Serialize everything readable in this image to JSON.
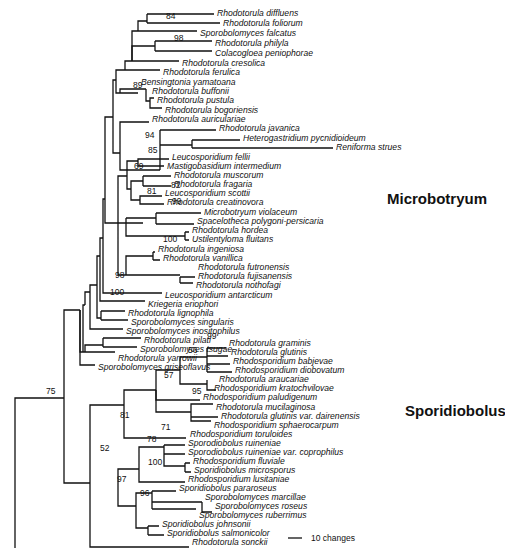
{
  "figure": {
    "type": "phylogenetic-tree",
    "clade_labels": [
      {
        "label": "Microbotryum",
        "x": 387,
        "y": 204
      },
      {
        "label": "Sporidiobolus",
        "x": 405,
        "y": 416
      }
    ],
    "scale_bar": {
      "label": "10 changes",
      "x1": 288,
      "x2": 302,
      "y": 538
    }
  },
  "taxa": [
    {
      "name": "Rhodotorula diffluens",
      "x": 217,
      "y": 13
    },
    {
      "name": "Rhodotorula foliorum",
      "x": 223,
      "y": 23
    },
    {
      "name": "Sporobolomyces falcatus",
      "x": 200,
      "y": 33
    },
    {
      "name": "Rhodotorula philyla",
      "x": 215,
      "y": 43
    },
    {
      "name": "Colacogloea peniophorae",
      "x": 215,
      "y": 53
    },
    {
      "name": "Rhodotorula cresolica",
      "x": 182,
      "y": 63
    },
    {
      "name": "Rhodotorula ferulica",
      "x": 163,
      "y": 72
    },
    {
      "name": "Bensingtonia yamatoana",
      "x": 141,
      "y": 82
    },
    {
      "name": "Rhodotorula buffonii",
      "x": 152,
      "y": 91
    },
    {
      "name": "Rhodotorula pustula",
      "x": 157,
      "y": 100
    },
    {
      "name": "Rhodotorula bogoriensis",
      "x": 165,
      "y": 110
    },
    {
      "name": "Rhodotorula auriculariae",
      "x": 152,
      "y": 119
    },
    {
      "name": "Rhodotorula javanica",
      "x": 219,
      "y": 128
    },
    {
      "name": "Heterogastridium pycnidioideum",
      "x": 243,
      "y": 138
    },
    {
      "name": "Reniforma strues",
      "x": 336,
      "y": 147
    },
    {
      "name": "Leucosporidium fellii",
      "x": 172,
      "y": 157
    },
    {
      "name": "Mastigobasidium intermedium",
      "x": 167,
      "y": 166
    },
    {
      "name": "Rhodotorula muscorum",
      "x": 174,
      "y": 175
    },
    {
      "name": "Rhodotorula fragaria",
      "x": 174,
      "y": 184
    },
    {
      "name": "Leucosporidium scottii",
      "x": 165,
      "y": 193
    },
    {
      "name": "Rhodotorula creatinovora",
      "x": 167,
      "y": 202
    },
    {
      "name": "Microbotryum violaceum",
      "x": 204,
      "y": 212
    },
    {
      "name": "Spacelotheca polygoni-persicaria",
      "x": 197,
      "y": 221
    },
    {
      "name": "Rhodotorula hordea",
      "x": 192,
      "y": 230
    },
    {
      "name": "Ustilentyloma fluitans",
      "x": 192,
      "y": 239
    },
    {
      "name": "Rhodotorula ingeniosa",
      "x": 158,
      "y": 249
    },
    {
      "name": "Rhodotorula vanillica",
      "x": 163,
      "y": 258
    },
    {
      "name": "Rhodotorula futronensis",
      "x": 198,
      "y": 267
    },
    {
      "name": "Rhodotorula fujisanensis",
      "x": 198,
      "y": 276
    },
    {
      "name": "Rhodotorula nothofagi",
      "x": 196,
      "y": 285
    },
    {
      "name": "Leucosporidium antarcticum",
      "x": 165,
      "y": 295
    },
    {
      "name": "Kriegeria eriophori",
      "x": 148,
      "y": 304
    },
    {
      "name": "Rhodotorula lignophila",
      "x": 128,
      "y": 313
    },
    {
      "name": "Sporobolomyces singularis",
      "x": 131,
      "y": 322
    },
    {
      "name": "Sporobolomyces inositophilus",
      "x": 126,
      "y": 331
    },
    {
      "name": "Rhodotorula pilati",
      "x": 144,
      "y": 340
    },
    {
      "name": "Sporobolomyces tsugae",
      "x": 140,
      "y": 349
    },
    {
      "name": "Rhodotorula yarrowii",
      "x": 118,
      "y": 358
    },
    {
      "name": "Sporobolomyces griseoflavus",
      "x": 98,
      "y": 367
    },
    {
      "name": "Rhodotorula graminis",
      "x": 229,
      "y": 343
    },
    {
      "name": "Rhodotorula glutinis",
      "x": 231,
      "y": 352
    },
    {
      "name": "Rhodosporidium babjevae",
      "x": 233,
      "y": 361
    },
    {
      "name": "Rhodosporidium diobovatum",
      "x": 235,
      "y": 370
    },
    {
      "name": "Rhodotorula araucariae",
      "x": 219,
      "y": 379
    },
    {
      "name": "Rhodosporidium kratochvilovae",
      "x": 214,
      "y": 388
    },
    {
      "name": "Rhodosporidium paludigenum",
      "x": 203,
      "y": 397
    },
    {
      "name": "Rhodotorula mucilaginosa",
      "x": 216,
      "y": 407
    },
    {
      "name": "Rhodotorula glutinis var. dairenensis",
      "x": 221,
      "y": 416
    },
    {
      "name": "Rhodosporidium sphaerocarpum",
      "x": 214,
      "y": 425
    },
    {
      "name": "Rhodosporidium toruloides",
      "x": 190,
      "y": 434
    },
    {
      "name": "Sporodiobolus ruineniae",
      "x": 188,
      "y": 443
    },
    {
      "name": "Sporodiobolus ruineniae var.  coprophilus",
      "x": 188,
      "y": 452
    },
    {
      "name": "Rhodosporidium fluviale",
      "x": 193,
      "y": 461
    },
    {
      "name": "Sporidiobolus microsporus",
      "x": 194,
      "y": 470
    },
    {
      "name": "Rhodosporidium lusitaniae",
      "x": 188,
      "y": 479
    },
    {
      "name": "Sporidiobolus pararoseus",
      "x": 179,
      "y": 488
    },
    {
      "name": "Sporobolomyces marcillae",
      "x": 205,
      "y": 497
    },
    {
      "name": "Sporobolomyces roseus",
      "x": 215,
      "y": 506
    },
    {
      "name": "Sporobolomyces ruberrimus",
      "x": 199,
      "y": 515
    },
    {
      "name": "Sporidiobolus johnsonii",
      "x": 162,
      "y": 524
    },
    {
      "name": "Sporidiobolus salmonicolor",
      "x": 167,
      "y": 533
    },
    {
      "name": "Rhodotorula sonckii",
      "x": 192,
      "y": 542
    }
  ],
  "bootstrap": [
    {
      "value": "84",
      "x": 166,
      "y": 19
    },
    {
      "value": "98",
      "x": 174,
      "y": 41
    },
    {
      "value": "89",
      "x": 133,
      "y": 88
    },
    {
      "value": "94",
      "x": 145,
      "y": 138
    },
    {
      "value": "85",
      "x": 148,
      "y": 153
    },
    {
      "value": "69",
      "x": 134,
      "y": 169
    },
    {
      "value": "81",
      "x": 147,
      "y": 194
    },
    {
      "value": "82",
      "x": 171,
      "y": 188
    },
    {
      "value": "99",
      "x": 172,
      "y": 204
    },
    {
      "value": "100",
      "x": 163,
      "y": 242
    },
    {
      "value": "98",
      "x": 115,
      "y": 278
    },
    {
      "value": "100",
      "x": 110,
      "y": 295
    },
    {
      "value": "99",
      "x": 207,
      "y": 339
    },
    {
      "value": "56",
      "x": 188,
      "y": 353
    },
    {
      "value": "57",
      "x": 164,
      "y": 378
    },
    {
      "value": "95",
      "x": 192,
      "y": 394
    },
    {
      "value": "81",
      "x": 120,
      "y": 418
    },
    {
      "value": "71",
      "x": 161,
      "y": 430
    },
    {
      "value": "78",
      "x": 147,
      "y": 442
    },
    {
      "value": "75",
      "x": 46,
      "y": 394
    },
    {
      "value": "52",
      "x": 100,
      "y": 451
    },
    {
      "value": "100",
      "x": 148,
      "y": 465
    },
    {
      "value": "97",
      "x": 117,
      "y": 482
    },
    {
      "value": "96",
      "x": 140,
      "y": 496
    }
  ],
  "branches": [
    "M15 548 V398 H64",
    "M64 398 V310 H80 M64 398 V483 H90",
    "M80 310 V365 H88 M88 365 H95",
    "M80 310 V352 H83 M83 352 H115",
    "M83 352 V305 H85 M85 352 V345 H103 M103 338 V347 M103 338 H141 M103 347 H137",
    "M85 305 V292 H90 M90 292 V329 H96 M96 329 H123 M90 292 V285 H97 M97 285 V318 H101 M101 311 V320 M101 311 H125 M101 320 H128",
    "M97 285 V256 H100 M100 256 V301 H110 M110 301 H145 M100 256 V238 H103 M103 238 V293 H107 M107 293 H162",
    "M103 238 V199 H105 M105 199 V117 H113",
    "M113 117 V80 H116 M116 80 V70 H125 M125 70 V61 H132 M132 61 V31 H138 M138 31 V21 H147 M147 14 V23 M147 14 H214 M147 23 H220 M138 31 H197",
    "M132 61 V46 H155 M155 41 V51 M155 41 H212 M155 51 H212 M132 61 H179 M125 70 H160",
    "M116 80 V93 H120 M120 93 H138 M120 93 V89 H146 M146 89 V101 H150 M150 101 V98 H154 M150 101 V108 H162",
    "M113 117 V153 H120 M120 153 V122 H149 M120 153 V170 H160 M160 130 H216 M160 130 V170 M160 145 H192 M192 140 V148 M192 140 H240 M192 148 H333",
    "M105 199 V223 H118 M118 223 H143 M118 223 V176 H127 M127 176 V189 H131 M131 189 V181 H143 M143 176 V186 M143 176 H171 M143 186 H171",
    "M131 189 V200 H140 M140 200 V196 H162 M140 200 V204 H164",
    "M127 176 V161 H138 M138 161 V159 H169 M138 161 V166 H164",
    "M118 223 V275 H126 M126 218 H156 M156 213 V224 M156 213 H201 M156 224 H194 M126 218 V236 H185 M185 232 V240 M185 232 H189 M185 240 H189",
    "M126 275 V256 H153 M153 252 V260 M153 252 H155 M153 260 H160 M126 275 H180 M180 277 V283 M180 277 H195 M180 283 H193",
    "M90 483 V405 H124 M124 405 V390 H156 M124 405 V438 H186",
    "M156 390 V370 H180 M180 370 V357 H207 M207 348 V372 M207 348 H226 M207 356 H228 M207 364 H230 M207 372 H232",
    "M180 370 V384 H207 M207 380 V390 H216 M207 390 H211 M156 390 V400 H200",
    "M156 390 V412 H191 M191 412 V404 H213 M191 412 V421 H211 M191 412 V417 H218",
    "M118 483 V469 H139 M139 469 V447 H164 M164 445 V454 M164 445 H185 M164 454 H185 M164 447 V466 H185 M185 463 V472 M185 463 H190 M185 472 H191 M139 469 V482 H185",
    "M118 483 V506 H136 M136 506 V493 H152 M152 491 V509 M152 491 H176 M152 502 H202 M202 502 V512 H212 M152 509 H196",
    "M136 506 V528 H148 M148 526 V535 M148 526 H159 M148 535 H164",
    "M90 483 V547 H189"
  ]
}
